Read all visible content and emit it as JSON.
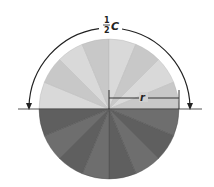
{
  "figure": {
    "sectors": 16,
    "colors": {
      "top_half_light": "#d9d9d9",
      "top_half_alt": "#c8c8c8",
      "bottom_half_dark": "#6e6e6e",
      "bottom_half_alt": "#5f5f5f",
      "lines": "#333333",
      "background": "#ffffff"
    },
    "labels": {
      "half_numerator": "1",
      "half_denominator": "2",
      "circumference": "C",
      "radius": "r"
    }
  }
}
